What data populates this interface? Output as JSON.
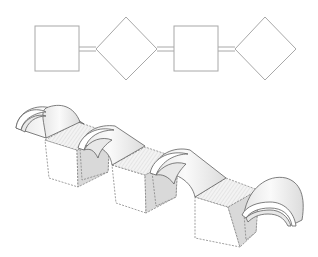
{
  "diagram": {
    "type": "architectural plan and isometric view",
    "plan": {
      "sequence": [
        "square",
        "diamond",
        "square",
        "diamond"
      ],
      "connector": "double-line",
      "stroke_color": "#a8a8a8",
      "shapes": [
        {
          "kind": "square",
          "x": 35,
          "y": 26,
          "w": 44,
          "h": 45
        },
        {
          "kind": "diamond",
          "cx": 126,
          "cy": 49,
          "rx": 31,
          "ry": 31
        },
        {
          "kind": "square",
          "x": 174,
          "y": 26,
          "w": 44,
          "h": 45
        },
        {
          "kind": "diamond",
          "cx": 265,
          "cy": 49,
          "rx": 31,
          "ry": 31
        }
      ]
    },
    "isometric": {
      "sequence": [
        "vault",
        "cube",
        "vault",
        "cube",
        "vault",
        "cube",
        "vault"
      ],
      "units": 3,
      "vaults": 4,
      "line_color": "#6e6e6e",
      "shading": "hatched top faces, grey side faces"
    }
  }
}
